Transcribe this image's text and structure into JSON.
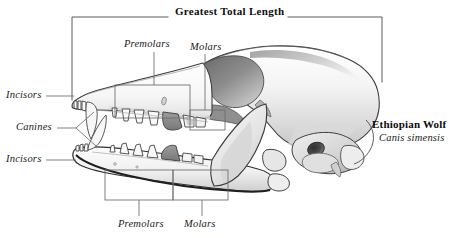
{
  "figure": {
    "type": "anatomical-illustration",
    "background_color": "#ffffff",
    "ink_color": "#1a1a1a",
    "shade_light": "#e8e8e8",
    "shade_mid": "#b8b8b8",
    "shade_dark": "#7d7d7d",
    "shade_darkest": "#5e5e5e"
  },
  "measurement": {
    "title": "Greatest Total Length",
    "bracket_left_x": 72,
    "bracket_right_x": 382,
    "bracket_top_y": 17,
    "bracket_left_bottom_y": 100,
    "bracket_right_bottom_y": 82
  },
  "species": {
    "common_name": "Ethiopian Wolf",
    "scientific_name": "Canis simensis"
  },
  "labels": {
    "upper_premolars": "Premolars",
    "upper_molars": "Molars",
    "upper_incisors": "Incisors",
    "canines": "Canines",
    "lower_incisors": "Incisors",
    "lower_premolars": "Premolars",
    "lower_molars": "Molars"
  },
  "callout_boxes": [
    {
      "name": "upper-premolars-box",
      "x": 115,
      "y": 85,
      "w": 75,
      "h": 33
    },
    {
      "name": "upper-molars-box",
      "x": 190,
      "y": 110,
      "w": 35,
      "h": 20
    },
    {
      "name": "lower-premolars-box",
      "x": 105,
      "y": 170,
      "w": 68,
      "h": 30
    },
    {
      "name": "lower-molars-box",
      "x": 173,
      "y": 170,
      "w": 55,
      "h": 30
    }
  ],
  "label_positions": {
    "upper_premolars": {
      "x": 124,
      "y": 40
    },
    "upper_molars": {
      "x": 190,
      "y": 44
    },
    "upper_incisors": {
      "x": 8,
      "y": 92
    },
    "canines": {
      "x": 18,
      "y": 124
    },
    "lower_incisors": {
      "x": 8,
      "y": 155
    },
    "lower_premolars": {
      "x": 120,
      "y": 222
    },
    "lower_molars": {
      "x": 186,
      "y": 222
    },
    "species_common": {
      "x": 373,
      "y": 120
    },
    "species_latin": {
      "x": 379,
      "y": 133
    },
    "title": {
      "x": 175,
      "y": 12
    }
  }
}
